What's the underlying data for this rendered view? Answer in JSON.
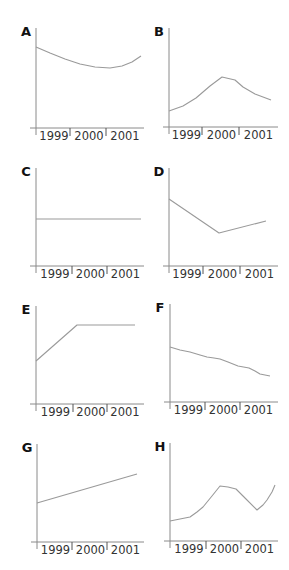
{
  "chart_data": [
    {
      "type": "line",
      "panel": "A",
      "categories": [
        "1999",
        "2000",
        "2001"
      ],
      "xlabel": "",
      "ylabel": "",
      "grid": false,
      "description": "Decreasing gently then rising at the end (shallow U)",
      "origin": [
        36,
        128
      ],
      "x_end": 144,
      "y_top": 28,
      "tick_x": [
        36,
        70,
        106
      ],
      "points": [
        [
          36,
          47
        ],
        [
          50,
          53
        ],
        [
          65,
          59
        ],
        [
          80,
          64
        ],
        [
          95,
          67
        ],
        [
          110,
          68
        ],
        [
          122,
          66
        ],
        [
          132,
          62
        ],
        [
          141,
          56
        ]
      ]
    },
    {
      "type": "line",
      "panel": "B",
      "categories": [
        "1999",
        "2000",
        "2001"
      ],
      "xlabel": "",
      "ylabel": "",
      "grid": false,
      "description": "Rising to a peak near 2000 then declining",
      "origin": [
        169,
        127
      ],
      "x_end": 278,
      "y_top": 28,
      "tick_x": [
        169,
        202,
        239
      ],
      "points": [
        [
          169,
          111
        ],
        [
          183,
          106
        ],
        [
          196,
          98
        ],
        [
          210,
          86
        ],
        [
          222,
          77
        ],
        [
          235,
          80
        ],
        [
          243,
          87
        ],
        [
          255,
          94
        ],
        [
          271,
          100
        ]
      ]
    },
    {
      "type": "line",
      "panel": "C",
      "categories": [
        "1999",
        "2000",
        "2001"
      ],
      "xlabel": "",
      "ylabel": "",
      "grid": false,
      "description": "Constant (flat horizontal line)",
      "origin": [
        36,
        266
      ],
      "x_end": 144,
      "y_top": 168,
      "tick_x": [
        36,
        72,
        107
      ],
      "points": [
        [
          36,
          219
        ],
        [
          141,
          219
        ]
      ]
    },
    {
      "type": "line",
      "panel": "D",
      "categories": [
        "1999",
        "2000",
        "2001"
      ],
      "xlabel": "",
      "ylabel": "",
      "grid": false,
      "description": "Falling to a minimum at 2000 then rising",
      "origin": [
        169,
        266
      ],
      "x_end": 278,
      "y_top": 168,
      "tick_x": [
        169,
        203,
        240
      ],
      "points": [
        [
          169,
          199
        ],
        [
          219,
          233
        ],
        [
          266,
          221
        ]
      ]
    },
    {
      "type": "line",
      "panel": "E",
      "categories": [
        "1999",
        "2000",
        "2001"
      ],
      "xlabel": "",
      "ylabel": "",
      "grid": false,
      "description": "Rising linearly until 2000 then constant",
      "origin": [
        36,
        404
      ],
      "x_end": 144,
      "y_top": 306,
      "tick_x": [
        36,
        73,
        107
      ],
      "points": [
        [
          36,
          361
        ],
        [
          77,
          325
        ],
        [
          135,
          325
        ]
      ]
    },
    {
      "type": "line",
      "panel": "F",
      "categories": [
        "1999",
        "2000",
        "2001"
      ],
      "xlabel": "",
      "ylabel": "",
      "grid": false,
      "description": "Steadily decreasing with small wiggles",
      "origin": [
        170,
        402
      ],
      "x_end": 278,
      "y_top": 304,
      "tick_x": [
        170,
        205,
        240
      ],
      "points": [
        [
          170,
          347
        ],
        [
          180,
          350
        ],
        [
          190,
          352
        ],
        [
          200,
          355
        ],
        [
          207,
          357
        ],
        [
          214,
          358
        ],
        [
          220,
          359
        ],
        [
          228,
          362
        ],
        [
          238,
          366
        ],
        [
          249,
          368
        ],
        [
          255,
          371
        ],
        [
          260,
          374
        ],
        [
          270,
          376
        ]
      ]
    },
    {
      "type": "line",
      "panel": "G",
      "categories": [
        "1999",
        "2000",
        "2001"
      ],
      "xlabel": "",
      "ylabel": "",
      "grid": false,
      "description": "Increasing linearly",
      "origin": [
        37,
        542
      ],
      "x_end": 144,
      "y_top": 444,
      "tick_x": [
        37,
        72,
        107
      ],
      "points": [
        [
          37,
          503
        ],
        [
          137,
          474
        ]
      ]
    },
    {
      "type": "line",
      "panel": "H",
      "categories": [
        "1999",
        "2000",
        "2001"
      ],
      "xlabel": "",
      "ylabel": "",
      "grid": false,
      "description": "Rising to a peak near 2000, falling to a trough late 2001, then rising sharply",
      "origin": [
        170,
        541
      ],
      "x_end": 278,
      "y_top": 443,
      "tick_x": [
        170,
        206,
        241
      ],
      "points": [
        [
          170,
          521
        ],
        [
          180,
          519
        ],
        [
          190,
          517
        ],
        [
          197,
          512
        ],
        [
          203,
          507
        ],
        [
          212,
          496
        ],
        [
          220,
          486
        ],
        [
          228,
          487
        ],
        [
          236,
          489
        ],
        [
          246,
          499
        ],
        [
          257,
          510
        ],
        [
          263,
          505
        ],
        [
          267,
          500
        ],
        [
          272,
          492
        ],
        [
          275,
          485
        ]
      ]
    }
  ],
  "labels": {
    "years": [
      "1999",
      "2000",
      "2001"
    ],
    "panels": [
      "A",
      "B",
      "C",
      "D",
      "E",
      "F",
      "G",
      "H"
    ]
  }
}
